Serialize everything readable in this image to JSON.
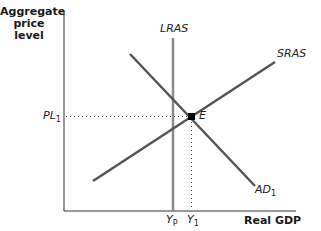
{
  "diagram": {
    "y_axis_label": "Aggregate price level",
    "y_axis_label_lines": [
      "Aggregate",
      "price",
      "level"
    ],
    "x_axis_label": "Real GDP",
    "curves": {
      "lras": {
        "label": "LRAS",
        "color": "#8a8a8a"
      },
      "sras": {
        "label": "SRAS",
        "color": "#555555"
      },
      "ad": {
        "label": "AD",
        "sub": "1",
        "color": "#555555"
      }
    },
    "equilibrium": {
      "label": "E"
    },
    "price_tick": {
      "label": "PL",
      "sub": "1"
    },
    "output_ticks": [
      {
        "label": "Y",
        "sub": "P"
      },
      {
        "label": "Y",
        "sub": "1"
      }
    ]
  }
}
